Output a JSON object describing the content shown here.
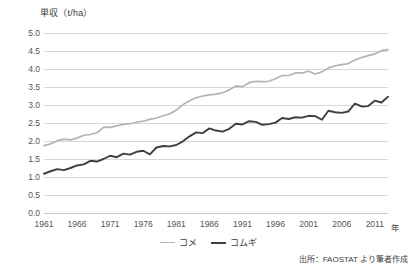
{
  "chart_data": {
    "type": "line",
    "title": "",
    "ylabel": "単収（t/ha）",
    "xlabel": "年",
    "ylim": [
      0.0,
      5.0
    ],
    "ytick_step": 0.5,
    "yticks": [
      "5.0",
      "4.5",
      "4.0",
      "3.5",
      "3.0",
      "2.5",
      "2.0",
      "1.5",
      "1.0",
      "0.5",
      "0.0"
    ],
    "xlim": [
      1961,
      2013
    ],
    "xticks": [
      "1961",
      "1966",
      "1971",
      "1976",
      "1981",
      "1986",
      "1991",
      "1996",
      "2001",
      "2006",
      "2011"
    ],
    "grid": true,
    "legend_position": "bottom-center",
    "source": "出所：FAOSTAT より筆者作成",
    "x": [
      1961,
      1962,
      1963,
      1964,
      1965,
      1966,
      1967,
      1968,
      1969,
      1970,
      1971,
      1972,
      1973,
      1974,
      1975,
      1976,
      1977,
      1978,
      1979,
      1980,
      1981,
      1982,
      1983,
      1984,
      1985,
      1986,
      1987,
      1988,
      1989,
      1990,
      1991,
      1992,
      1993,
      1994,
      1995,
      1996,
      1997,
      1998,
      1999,
      2000,
      2001,
      2002,
      2003,
      2004,
      2005,
      2006,
      2007,
      2008,
      2009,
      2010,
      2011,
      2012,
      2013
    ],
    "series": [
      {
        "name": "コメ",
        "color": "#b3b3b3",
        "values": [
          1.87,
          1.92,
          2.01,
          2.05,
          2.03,
          2.08,
          2.16,
          2.18,
          2.23,
          2.38,
          2.38,
          2.42,
          2.46,
          2.48,
          2.52,
          2.55,
          2.6,
          2.64,
          2.7,
          2.75,
          2.86,
          3.01,
          3.12,
          3.2,
          3.25,
          3.28,
          3.3,
          3.34,
          3.42,
          3.53,
          3.51,
          3.62,
          3.66,
          3.65,
          3.66,
          3.73,
          3.82,
          3.82,
          3.89,
          3.89,
          3.94,
          3.86,
          3.92,
          4.03,
          4.09,
          4.12,
          4.15,
          4.25,
          4.32,
          4.37,
          4.42,
          4.51,
          4.54
        ]
      },
      {
        "name": "コムギ",
        "color": "#3f3f3f",
        "values": [
          1.09,
          1.16,
          1.22,
          1.19,
          1.25,
          1.32,
          1.35,
          1.45,
          1.43,
          1.5,
          1.59,
          1.55,
          1.65,
          1.62,
          1.7,
          1.73,
          1.63,
          1.82,
          1.86,
          1.85,
          1.89,
          1.99,
          2.13,
          2.24,
          2.22,
          2.35,
          2.29,
          2.26,
          2.34,
          2.48,
          2.46,
          2.55,
          2.53,
          2.45,
          2.47,
          2.51,
          2.64,
          2.61,
          2.66,
          2.65,
          2.7,
          2.69,
          2.59,
          2.84,
          2.8,
          2.78,
          2.82,
          3.04,
          2.96,
          2.97,
          3.12,
          3.07,
          3.23
        ]
      }
    ]
  },
  "legend": {
    "items": [
      {
        "label": "コメ"
      },
      {
        "label": "コムギ"
      }
    ]
  },
  "axes": {
    "y_title": "単収（t/ha）",
    "x_title": "年"
  },
  "footer": {
    "source": "出所：FAOSTAT より筆者作成"
  }
}
